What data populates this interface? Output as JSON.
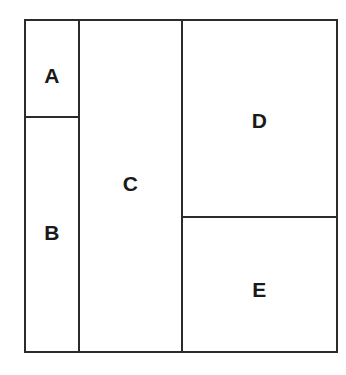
{
  "diagram": {
    "type": "partitioned-rectangle",
    "stroke_color": "#2b2b2b",
    "background_color": "#ffffff",
    "label_color": "#1a1a1a",
    "regions": [
      {
        "id": "a",
        "label": "A"
      },
      {
        "id": "b",
        "label": "B"
      },
      {
        "id": "c",
        "label": "C"
      },
      {
        "id": "d",
        "label": "D"
      },
      {
        "id": "e",
        "label": "E"
      }
    ]
  }
}
